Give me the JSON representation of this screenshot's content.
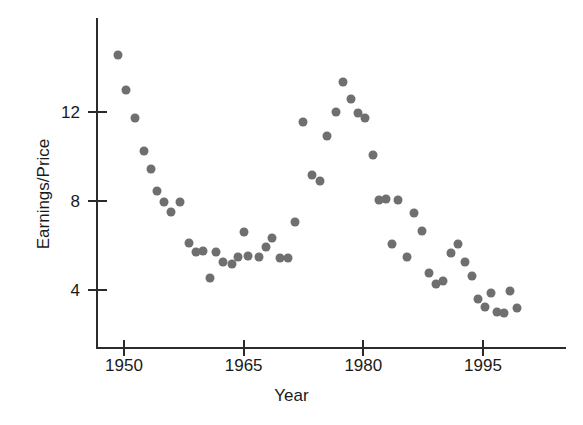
{
  "chart_data": {
    "type": "scatter",
    "title": "",
    "xlabel": "Year",
    "ylabel": "Earnings/Price",
    "xlim": [
      1948.2,
      2000.5
    ],
    "ylim": [
      2.4,
      15.2
    ],
    "grid": false,
    "legend": null,
    "marker": {
      "shape": "circle",
      "color": "#6f6f6f",
      "size_px": 9
    },
    "axis_color": "#2b2b2b",
    "xticks": [
      1950,
      1965,
      1980,
      1995
    ],
    "xtick_labels": [
      "1950",
      "1965",
      "1980",
      "1995"
    ],
    "yticks": [
      4,
      8,
      12
    ],
    "ytick_labels": [
      "4",
      "8",
      "12"
    ],
    "x": [
      1949.3,
      1950.3,
      1951.4,
      1952.5,
      1953.4,
      1954.1,
      1955.0,
      1955.9,
      1957.0,
      1958.1,
      1959.0,
      1959.9,
      1960.8,
      1961.5,
      1962.4,
      1963.5,
      1964.3,
      1965.1,
      1965.6,
      1966.9,
      1967.8,
      1968.6,
      1969.6,
      1970.5,
      1971.4,
      1972.4,
      1973.6,
      1974.6,
      1975.5,
      1976.6,
      1977.5,
      1978.5,
      1979.3,
      1980.2,
      1981.2,
      1982.0,
      1982.8,
      1983.6,
      1984.4,
      1985.5,
      1986.4,
      1987.3,
      1988.2,
      1989.1,
      1990.0,
      1991.0,
      1991.9,
      1992.7,
      1993.6,
      1994.4,
      1995.3,
      1996.0,
      1996.8,
      1997.6,
      1998.4,
      1999.3
    ],
    "y": [
      14.55,
      13.0,
      11.75,
      10.25,
      9.45,
      8.45,
      7.95,
      7.5,
      7.95,
      6.1,
      5.7,
      5.75,
      4.55,
      5.7,
      5.25,
      5.15,
      5.5,
      6.6,
      5.55,
      5.5,
      5.95,
      6.35,
      5.45,
      5.45,
      7.05,
      11.55,
      9.15,
      8.9,
      10.9,
      12.0,
      13.35,
      12.6,
      11.95,
      11.75,
      10.05,
      8.05,
      8.1,
      6.05,
      8.05,
      5.5,
      7.45,
      6.65,
      4.75,
      4.25,
      4.4,
      5.65,
      6.05,
      5.25,
      4.65,
      3.6,
      3.25,
      3.85,
      3.0,
      2.95,
      3.95,
      3.2
    ],
    "points_count": 56
  }
}
